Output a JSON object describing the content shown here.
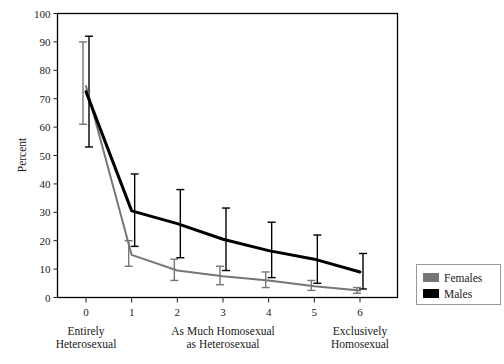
{
  "figure": {
    "ylabel": "Percent",
    "xlabel": "",
    "title": "",
    "y_ticks": [
      "0",
      "10",
      "20",
      "30",
      "40",
      "50",
      "60",
      "70",
      "80",
      "90",
      "100"
    ],
    "x_ticks": [
      "0",
      "1",
      "2",
      "3",
      "4",
      "5",
      "6"
    ],
    "category_labels": [
      {
        "position": 0,
        "line1": "Entirely",
        "line2": "Heterosexual"
      },
      {
        "position": 3,
        "line1": "As Much Homosexual",
        "line2": "as Heterosexual"
      },
      {
        "position": 6,
        "line1": "Exclusively",
        "line2": "Homosexual"
      }
    ]
  },
  "legend": {
    "items": [
      {
        "label": "Females",
        "color": "#767676"
      },
      {
        "label": "Males",
        "color": "#000000"
      }
    ]
  },
  "chart_data": {
    "type": "line",
    "title": "",
    "xlabel": "",
    "ylabel": "Percent",
    "xlim": [
      0,
      6
    ],
    "ylim": [
      0,
      100
    ],
    "grid": false,
    "legend_position": "right-outside",
    "x": [
      0,
      1,
      2,
      3,
      4,
      5,
      6
    ],
    "x_tick_labels": [
      "0",
      "1",
      "2",
      "3",
      "4",
      "5",
      "6"
    ],
    "y_tick_labels": [
      "0",
      "10",
      "20",
      "30",
      "40",
      "50",
      "60",
      "70",
      "80",
      "90",
      "100"
    ],
    "annotations": [
      "Entirely Heterosexual",
      "As Much Homosexual as Heterosexual",
      "Exclusively Homosexual"
    ],
    "error_bars": true,
    "series": [
      {
        "name": "Females",
        "color": "#767676",
        "values": [
          74.5,
          15.0,
          9.5,
          7.5,
          6.0,
          4.0,
          2.5
        ],
        "error_low": [
          61.0,
          11.0,
          6.0,
          4.5,
          3.5,
          2.5,
          1.5
        ],
        "error_high": [
          90.0,
          20.0,
          13.5,
          11.0,
          9.0,
          6.0,
          3.5
        ]
      },
      {
        "name": "Males",
        "color": "#000000",
        "values": [
          72.5,
          30.5,
          26.0,
          20.5,
          16.5,
          13.5,
          9.0
        ],
        "error_low": [
          53.0,
          18.0,
          14.0,
          9.5,
          7.0,
          5.0,
          3.0
        ],
        "error_high": [
          92.0,
          43.5,
          38.0,
          31.5,
          26.5,
          22.0,
          15.5
        ]
      }
    ]
  }
}
